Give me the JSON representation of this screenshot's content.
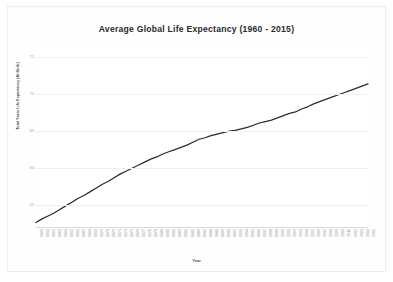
{
  "chart_data": {
    "type": "line",
    "title": "Average Global Life Expectancy (1960 - 2015)",
    "xlabel": "Year",
    "ylabel": "Total Years Life Expectancy (At Birth)",
    "ylim": [
      52,
      76
    ],
    "yticks": [
      55,
      60,
      65,
      70,
      75
    ],
    "ytick_labels": [
      "55",
      "60",
      "65",
      "70",
      "75"
    ],
    "grid": true,
    "legend": false,
    "line_color": "#2b2b2d",
    "background_color": "#ffffff",
    "categories": [
      "1960",
      "1961",
      "1962",
      "1963",
      "1964",
      "1965",
      "1966",
      "1967",
      "1968",
      "1969",
      "1970",
      "1971",
      "1972",
      "1973",
      "1974",
      "1975",
      "1976",
      "1977",
      "1978",
      "1979",
      "1980",
      "1981",
      "1982",
      "1983",
      "1984",
      "1985",
      "1986",
      "1987",
      "1988",
      "1989",
      "1990",
      "1991",
      "1992",
      "1993",
      "1994",
      "1995",
      "1996",
      "1997",
      "1998",
      "1999",
      "2000",
      "2001",
      "2002",
      "2003",
      "2004",
      "2005",
      "2006",
      "2007",
      "2008",
      "2009",
      "2010",
      "2011",
      "2012",
      "2013",
      "2014",
      "2015"
    ],
    "values": [
      52.6,
      53.1,
      53.5,
      53.9,
      54.4,
      54.9,
      55.4,
      55.9,
      56.3,
      56.8,
      57.3,
      57.8,
      58.2,
      58.7,
      59.2,
      59.6,
      60.0,
      60.4,
      60.8,
      61.2,
      61.5,
      61.9,
      62.2,
      62.5,
      62.8,
      63.1,
      63.5,
      63.9,
      64.1,
      64.4,
      64.6,
      64.8,
      65.0,
      65.1,
      65.3,
      65.5,
      65.8,
      66.1,
      66.3,
      66.5,
      66.8,
      67.1,
      67.4,
      67.6,
      68.0,
      68.3,
      68.7,
      69.0,
      69.3,
      69.6,
      69.9,
      70.2,
      70.5,
      70.8,
      71.1,
      71.4
    ]
  }
}
